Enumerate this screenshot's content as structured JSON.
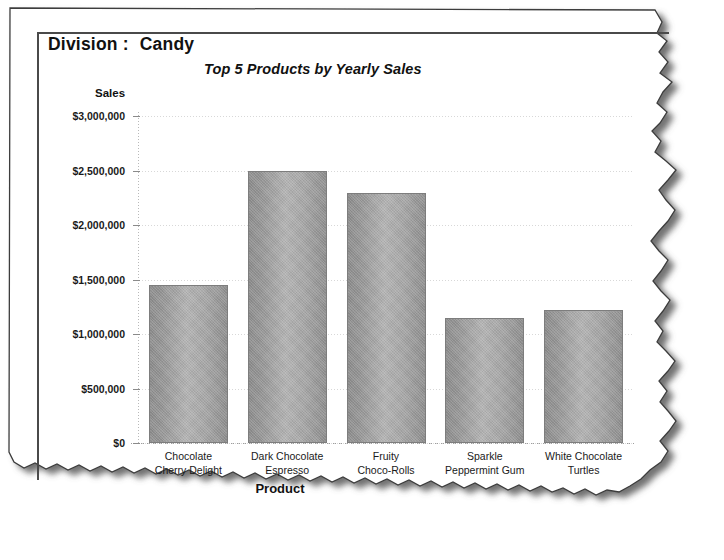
{
  "report": {
    "division_label": "Division :",
    "division_value": "Candy",
    "chart_title": "Top 5 Products by Yearly Sales"
  },
  "chart_data": {
    "type": "bar",
    "title": "Top 5 Products by Yearly Sales",
    "xlabel": "Product",
    "ylabel": "Sales",
    "categories": [
      "Chocolate\nCherry Delight",
      "Dark Chocolate\nEspresso",
      "Fruity\nChoco-Rolls",
      "Sparkle\nPeppermint Gum",
      "White Chocolate\nTurtles"
    ],
    "values": [
      1450000,
      2500000,
      2290000,
      1145000,
      1220000
    ],
    "ylim": [
      0,
      3000000
    ],
    "yticks": [
      0,
      500000,
      1000000,
      1500000,
      2000000,
      2500000,
      3000000
    ],
    "ytick_labels": [
      "$0",
      "$500,000",
      "$1,000,000",
      "$1,500,000",
      "$2,000,000",
      "$2,500,000",
      "$3,000,000"
    ],
    "grid": true,
    "legend": false,
    "bar_color": "#a5a5a5"
  },
  "style": {
    "frame_color": "#4a4a4a",
    "grid_color": "#d8d8d8",
    "text_color": "#111111"
  }
}
